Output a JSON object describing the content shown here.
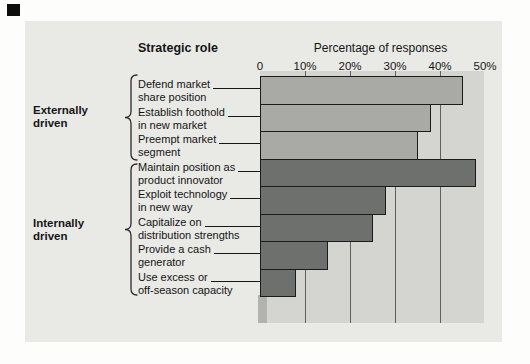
{
  "figure": {
    "column_header": "Strategic role",
    "groups": [
      {
        "line1": "Externally",
        "line2": "driven"
      },
      {
        "line1": "Internally",
        "line2": "driven"
      }
    ]
  },
  "chart_data": {
    "type": "bar",
    "orientation": "horizontal",
    "xlabel": "Percentage of responses",
    "ylabel": "Strategic role",
    "xlim": [
      0,
      50
    ],
    "x_ticks": [
      "0",
      "10%",
      "20%",
      "30%",
      "40%",
      "50%"
    ],
    "grid": true,
    "legend": "none",
    "groups": [
      {
        "name": "Externally driven",
        "bar_indexes": [
          0,
          1,
          2
        ]
      },
      {
        "name": "Internally driven",
        "bar_indexes": [
          3,
          4,
          5,
          6,
          7
        ]
      }
    ],
    "bars": [
      {
        "label": "Defend market share position",
        "line1": "Defend market",
        "line2": "share position",
        "value": 45,
        "group": "externally-driven"
      },
      {
        "label": "Establish foothold in new market",
        "line1": "Establish foothold",
        "line2": "in new market",
        "value": 38,
        "group": "externally-driven"
      },
      {
        "label": "Preempt market segment",
        "line1": "Preempt market",
        "line2": "segment",
        "value": 35,
        "group": "externally-driven"
      },
      {
        "label": "Maintain position as product innovator",
        "line1": "Maintain position as",
        "line2": "product innovator",
        "value": 48,
        "group": "internally-driven"
      },
      {
        "label": "Exploit technology in new way",
        "line1": "Exploit technology",
        "line2": "in new way",
        "value": 28,
        "group": "internally-driven"
      },
      {
        "label": "Capitalize on distribution strengths",
        "line1": "Capitalize on",
        "line2": "distribution strengths",
        "value": 25,
        "group": "internally-driven"
      },
      {
        "label": "Provide a cash generator",
        "line1": "Provide a cash",
        "line2": "generator",
        "value": 15,
        "group": "internally-driven"
      },
      {
        "label": "Use excess or off-season capacity",
        "line1": "Use excess or",
        "line2": "off-season capacity",
        "value": 8,
        "group": "internally-driven"
      }
    ],
    "colors": {
      "externally-driven": "#a9aaa6",
      "internally-driven": "#6e706e"
    }
  }
}
